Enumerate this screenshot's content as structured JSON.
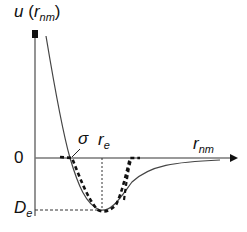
{
  "diagram": {
    "y_axis_label": {
      "main": "u",
      "paren_open": "(",
      "var": "r",
      "sub": "nm",
      "paren_close": ")"
    },
    "x_axis_label": {
      "var": "r",
      "sub": "nm"
    },
    "zero_label": "0",
    "depth_label": {
      "var": "D",
      "sub": "e"
    },
    "sigma_label": "σ",
    "re_label": {
      "var": "r",
      "sub": "e"
    },
    "colors": {
      "axis": "#555555",
      "curve": "#444444",
      "dashed": "#111111"
    }
  }
}
